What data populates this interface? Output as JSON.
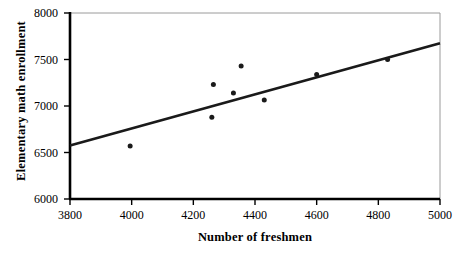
{
  "chart_data": {
    "type": "scatter",
    "title": "",
    "xlabel": "Number of freshmen",
    "ylabel": "Elementary math enrollment",
    "xlim": [
      3800,
      5000
    ],
    "ylim": [
      6000,
      8000
    ],
    "xticks": [
      3800,
      4000,
      4200,
      4400,
      4600,
      4800,
      5000
    ],
    "yticks": [
      6000,
      6500,
      7000,
      7500,
      8000
    ],
    "xtick_labels": [
      "3800",
      "4000",
      "4200",
      "4400",
      "4600",
      "4800",
      "5000"
    ],
    "ytick_labels": [
      "6000",
      "6500",
      "7000",
      "7500",
      "8000"
    ],
    "grid": false,
    "legend": false,
    "points": [
      {
        "x": 3995,
        "y": 6570
      },
      {
        "x": 4260,
        "y": 6880
      },
      {
        "x": 4265,
        "y": 7230
      },
      {
        "x": 4330,
        "y": 7140
      },
      {
        "x": 4355,
        "y": 7430
      },
      {
        "x": 4430,
        "y": 7065
      },
      {
        "x": 4600,
        "y": 7340
      },
      {
        "x": 4830,
        "y": 7500
      }
    ],
    "trend_line": {
      "x0": 3800,
      "y0": 6575,
      "x1": 5000,
      "y1": 7675
    },
    "marker_color": "#1a1a1a",
    "line_color": "#1a1a1a",
    "axis_color": "#000000",
    "frame_color": "#9a9a9a",
    "background_color": "#ffffff"
  }
}
